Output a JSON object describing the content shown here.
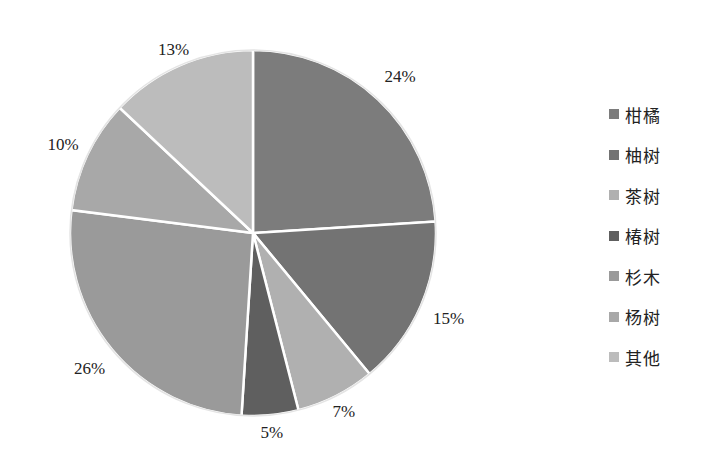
{
  "chart_data": {
    "type": "pie",
    "title": "",
    "start_angle_deg": 0,
    "direction": "clockwise",
    "categories": [
      "柑橘",
      "柚树",
      "茶树",
      "椿树",
      "杉木",
      "杨树",
      "其他"
    ],
    "values": [
      24,
      15,
      7,
      5,
      26,
      10,
      13
    ],
    "labels": [
      "24%",
      "15%",
      "7%",
      "5%",
      "26%",
      "10%",
      "13%"
    ],
    "colors": [
      "#7c7c7c",
      "#737373",
      "#b0b0b0",
      "#5f5f5f",
      "#9a9a9a",
      "#a8a8a8",
      "#bcbcbc"
    ],
    "legend_position": "right",
    "slice_border_color": "#ffffff"
  },
  "legend": {
    "items": [
      {
        "label": "柑橘",
        "color": "#7c7c7c"
      },
      {
        "label": "柚树",
        "color": "#737373"
      },
      {
        "label": "茶树",
        "color": "#b0b0b0"
      },
      {
        "label": "椿树",
        "color": "#5f5f5f"
      },
      {
        "label": "杉木",
        "color": "#9a9a9a"
      },
      {
        "label": "杨树",
        "color": "#a8a8a8"
      },
      {
        "label": "其他",
        "color": "#bcbcbc"
      }
    ]
  }
}
